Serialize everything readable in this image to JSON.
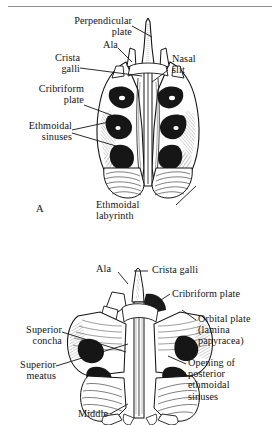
{
  "figure": {
    "background_color": "#ffffff",
    "ink_color": "#141414",
    "rule_color": "#8d8d8d"
  },
  "panel_a": {
    "letter": "A",
    "view": "anterior view of ethmoid bone",
    "labels": {
      "perpendicular_plate": "Perpendicular\nplate",
      "ala": "Ala",
      "crista_galli": "Crista\ngalli",
      "cribriform_plate": "Cribriform\nplate",
      "ethmoidal_sinuses": "Ethmoidal\nsinuses",
      "nasal_slit": "Nasal\nslit",
      "ethmoidal_labyrinth": "Ethmoidal\nlabyrinth"
    }
  },
  "panel_b": {
    "view": "posterior view of ethmoid bone",
    "labels": {
      "ala": "Ala",
      "crista_galli": "Crista galli",
      "cribriform_plate": "Cribriform plate",
      "orbital_plate": "Orbital plate\n(lamina\npapyracea)",
      "superior_concha": "Superior\nconcha",
      "superior_meatus": "Superior\nmeatus",
      "middle": "Middle",
      "opening_posterior_ethmoidal_sinuses": "Opening of\nposterior\nethmoidal\nsinuses"
    }
  }
}
